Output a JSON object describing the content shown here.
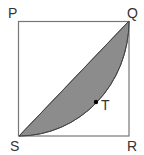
{
  "figure": {
    "type": "geometry",
    "shape": "square with shaded segment between diagonal SQ and quarter-circle arc",
    "vertices": {
      "P": "P",
      "Q": "Q",
      "R": "R",
      "S": "S"
    },
    "point_label": "T",
    "colors": {
      "stroke": "#555555",
      "fill": "#8c8c8c",
      "point": "#000000"
    }
  }
}
